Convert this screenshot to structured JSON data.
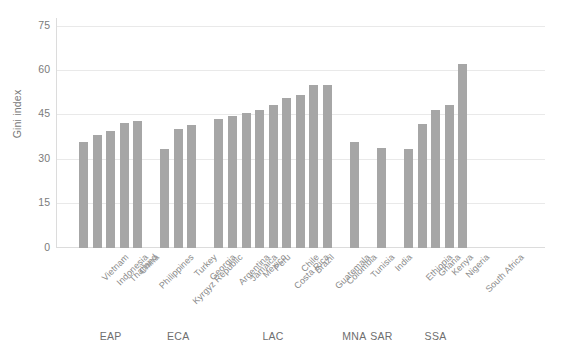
{
  "chart_data": {
    "type": "bar",
    "title": "",
    "xlabel": "",
    "ylabel": "Gini index",
    "ylim": [
      0,
      78
    ],
    "yticks": [
      0,
      15,
      30,
      45,
      60,
      75
    ],
    "ytick_labels": [
      "0",
      "15",
      "30",
      "45",
      "60",
      "75"
    ],
    "grid": true,
    "legend": null,
    "bar_color": "#a6a6a6",
    "categories": [
      "Vietnam",
      "Indonesia",
      "Thailand",
      "China",
      "Philippines",
      "Kyrgyz Republic",
      "Turkey",
      "Georgia",
      "Argentina",
      "Jamaica",
      "Mexico",
      "Peru",
      "Costa Rica",
      "Chile",
      "Brazil",
      "Guatemala",
      "Colombia",
      "Tunisia",
      "India",
      "Ethiopia",
      "Ghana",
      "Kenya",
      "Nigeria",
      "South Africa"
    ],
    "values": [
      35.6,
      38.1,
      39.3,
      42.1,
      42.7,
      33.4,
      40.0,
      41.5,
      43.6,
      44.5,
      45.4,
      46.5,
      48.3,
      50.5,
      51.5,
      54.8,
      55.1,
      35.8,
      33.6,
      33.2,
      41.9,
      46.5,
      48.1,
      62.0
    ],
    "groups": [
      {
        "label": "EAP",
        "start": 0,
        "count": 5
      },
      {
        "label": "ECA",
        "start": 5,
        "count": 3
      },
      {
        "label": "LAC",
        "start": 8,
        "count": 9
      },
      {
        "label": "MNA",
        "start": 17,
        "count": 1
      },
      {
        "label": "SAR",
        "start": 18,
        "count": 1
      },
      {
        "label": "SSA",
        "start": 19,
        "count": 5
      }
    ]
  }
}
